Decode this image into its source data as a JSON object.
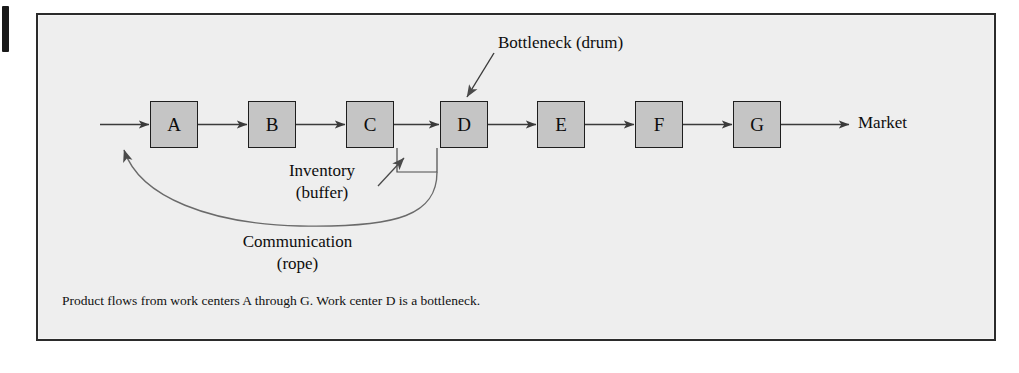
{
  "figure": {
    "type": "process-flow-diagram",
    "caption": "Product flows from work centers A through G. Work center D is a bottleneck.",
    "background_color": "#eeeeee",
    "box_fill_color": "#c5c5c5",
    "line_color": "#2b2b2b"
  },
  "work_centers": [
    {
      "id": "A",
      "label": "A",
      "x": 150,
      "y": 101,
      "bottleneck": false
    },
    {
      "id": "B",
      "label": "B",
      "x": 248,
      "y": 101,
      "bottleneck": false
    },
    {
      "id": "C",
      "label": "C",
      "x": 346,
      "y": 101,
      "bottleneck": false
    },
    {
      "id": "D",
      "label": "D",
      "x": 440,
      "y": 101,
      "bottleneck": true
    },
    {
      "id": "E",
      "label": "E",
      "x": 537,
      "y": 101,
      "bottleneck": false
    },
    {
      "id": "F",
      "label": "F",
      "x": 635,
      "y": 101,
      "bottleneck": false
    },
    {
      "id": "G",
      "label": "G",
      "x": 733,
      "y": 101,
      "bottleneck": false
    }
  ],
  "annotations": {
    "bottleneck": "Bottleneck (drum)",
    "inventory_line1": "Inventory",
    "inventory_line2": "(buffer)",
    "communication_line1": "Communication",
    "communication_line2": "(rope)",
    "market": "Market"
  },
  "flow": {
    "input_arrow": "material input into work center A",
    "output_arrow": "finished product to Market",
    "rope_feedback": "communication (rope) from buffer back to input of A"
  }
}
